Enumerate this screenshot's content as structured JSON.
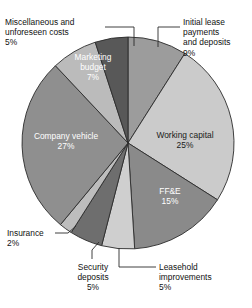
{
  "chart_data": {
    "type": "pie",
    "title": "",
    "subtitle": "",
    "xlabel": "",
    "ylabel": "",
    "legend_position": "none",
    "grid": false,
    "units": "percent",
    "start_angle_deg": 0,
    "direction": "clockwise",
    "categories": [
      "Initial lease payments and deposits",
      "Working capital",
      "FF&E",
      "Leasehold improvements",
      "Security deposits",
      "Insurance",
      "Company vehicle",
      "Marketing budget",
      "Miscellaneous and unforeseen costs"
    ],
    "values": [
      9,
      25,
      15,
      5,
      5,
      2,
      27,
      7,
      5
    ],
    "slices": [
      {
        "name": "Initial lease payments and deposits",
        "value": 9,
        "value_label": "9%",
        "color": "#9c9c9c",
        "label_placement": "callout",
        "text_color": "#111111"
      },
      {
        "name": "Working capital",
        "value": 25,
        "value_label": "25%",
        "color": "#cbcbcb",
        "label_placement": "inside",
        "text_color": "#1a1a1a"
      },
      {
        "name": "FF&E",
        "value": 15,
        "value_label": "15%",
        "color": "#8a8a8a",
        "label_placement": "inside",
        "text_color": "#ffffff"
      },
      {
        "name": "Leasehold improvements",
        "value": 5,
        "value_label": "5%",
        "color": "#cfcfcf",
        "label_placement": "callout",
        "text_color": "#111111"
      },
      {
        "name": "Security deposits",
        "value": 5,
        "value_label": "5%",
        "color": "#6e6e6e",
        "label_placement": "callout",
        "text_color": "#111111"
      },
      {
        "name": "Insurance",
        "value": 2,
        "value_label": "2%",
        "color": "#bdbdbd",
        "label_placement": "callout",
        "text_color": "#111111"
      },
      {
        "name": "Company vehicle",
        "value": 27,
        "value_label": "27%",
        "color": "#8f8f8f",
        "label_placement": "inside",
        "text_color": "#ffffff"
      },
      {
        "name": "Marketing budget",
        "value": 7,
        "value_label": "7%",
        "color": "#bbbbbb",
        "label_placement": "inside",
        "text_color": "#ffffff"
      },
      {
        "name": "Miscellaneous and unforeseen costs",
        "value": 5,
        "value_label": "5%",
        "color": "#585858",
        "label_placement": "callout",
        "text_color": "#111111"
      }
    ]
  },
  "labels": {
    "miscellaneous": {
      "line1": "Miscellaneous and",
      "line2": "unforeseen costs",
      "line3": "5%"
    },
    "initial_lease": {
      "line1": "Initial lease",
      "line2": "payments",
      "line3": "and deposits",
      "line4": "9%"
    },
    "marketing": {
      "line1": "Marketing",
      "line2": "budget",
      "line3": "7%"
    },
    "company_vehicle": {
      "line1": "Company vehicle",
      "line2": "27%"
    },
    "working_capital": {
      "line1": "Working capital",
      "line2": "25%"
    },
    "ffe": {
      "line1": "FF&E",
      "line2": "15%"
    },
    "insurance": {
      "line1": "Insurance",
      "line2": "2%"
    },
    "security": {
      "line1": "Security",
      "line2": "deposits",
      "line3": "5%"
    },
    "leasehold": {
      "line1": "Leasehold",
      "line2": "improvements",
      "line3": "5%"
    }
  },
  "style": {
    "pie_outline": "#2b2b2b",
    "leader_line": "#2b2b2b",
    "background": "#ffffff"
  }
}
